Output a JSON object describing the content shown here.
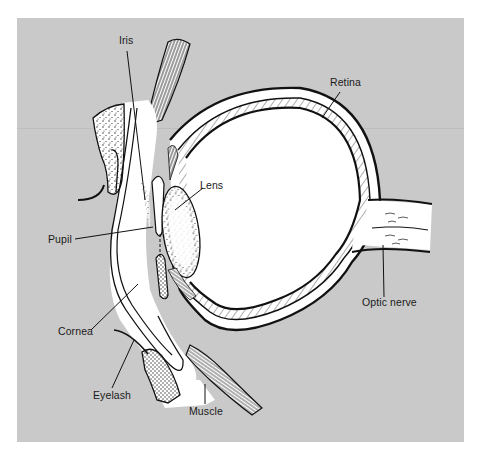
{
  "figure": {
    "title": "",
    "background_color": "#c9c9c9",
    "fill_color": "#ffffff",
    "line_color": "#111111"
  },
  "labels": {
    "iris": "Iris",
    "retina": "Retina",
    "lens": "Lens",
    "pupil": "Pupil",
    "cornea": "Cornea",
    "optic_nerve": "Optic nerve",
    "eyelash": "Eyelash",
    "muscle": "Muscle"
  }
}
